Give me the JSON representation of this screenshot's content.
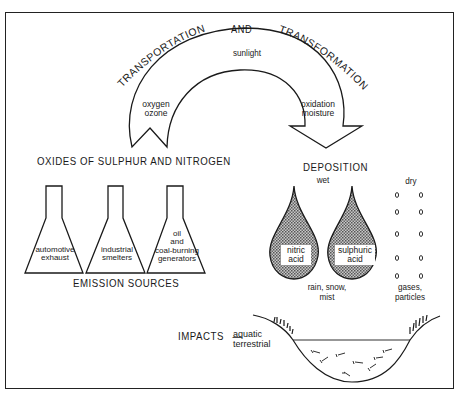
{
  "diagram": {
    "title_parts": {
      "left": "TRANSPORTATION",
      "center": "AND",
      "right": "TRANSFORMATION"
    },
    "cycle_arrow": {
      "top_factor": "sunlight",
      "left_factors": [
        "oxygen",
        "ozone"
      ],
      "right_factors": [
        "oxidation",
        "moisture"
      ]
    },
    "emissions": {
      "heading": "OXIDES OF SULPHUR AND NITROGEN",
      "sources": [
        {
          "lines": [
            "automotive",
            "exhaust"
          ]
        },
        {
          "lines": [
            "industrial",
            "smelters"
          ]
        },
        {
          "lines": [
            "oil",
            "and",
            "coal-burning",
            "generators"
          ]
        }
      ],
      "footer": "EMISSION SOURCES"
    },
    "deposition": {
      "heading": "DEPOSITION",
      "wet": {
        "label": "wet",
        "drops": [
          {
            "lines": [
              "nitric",
              "acid"
            ]
          },
          {
            "lines": [
              "sulphuric",
              "acid"
            ]
          }
        ],
        "caption_lines": [
          "rain, snow,",
          "mist"
        ]
      },
      "dry": {
        "label": "dry",
        "particle_symbol": "o",
        "caption_lines": [
          "gases,",
          "particles"
        ]
      }
    },
    "impacts": {
      "label": "IMPACTS",
      "dash": "—",
      "types": [
        "aquatic",
        "terrestrial"
      ]
    },
    "colors": {
      "ink": "#1a1a1a",
      "drop_fill": "#9a9a9a",
      "background": "#ffffff"
    }
  }
}
